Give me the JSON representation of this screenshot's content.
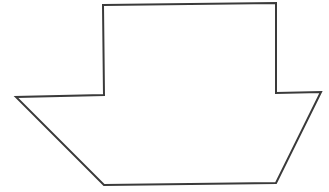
{
  "diagram": {
    "type": "line-drawing",
    "shape": "boat-silhouette",
    "stroke_color": "#3a3a3a",
    "fill_color": "#ffffff",
    "stroke_width": 2,
    "points": "103,5 276,3 276,93 321,92 276,183 104,185 16,97 104,95"
  }
}
